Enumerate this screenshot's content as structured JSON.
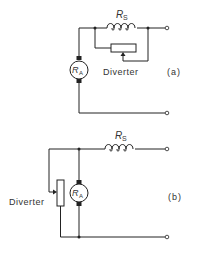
{
  "circuit_a": {
    "series_resistor_label": "R",
    "series_resistor_sub": "S",
    "armature_label": "R",
    "armature_sub": "A",
    "diverter_label": "Diverter",
    "caption": "(a)"
  },
  "circuit_b": {
    "series_resistor_label": "R",
    "series_resistor_sub": "S",
    "armature_label": "R",
    "armature_sub": "A",
    "diverter_label": "Diverter",
    "caption": "(b)"
  },
  "colors": {
    "line": "#222222",
    "text": "#333333",
    "background": "#ffffff"
  }
}
